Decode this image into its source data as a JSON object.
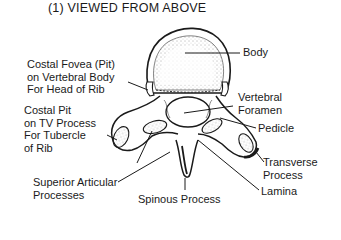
{
  "title": "(1) VIEWED FROM ABOVE",
  "labels": {
    "body": "Body",
    "costal_fovea": [
      "Costal Fovea (Pit)",
      "on Vertebral Body",
      "For Head of Rib"
    ],
    "costal_pit": [
      "Costal Pit",
      "on TV Process",
      "For Tubercle",
      "of Rib"
    ],
    "vertebral_foramen": [
      "Vertebral",
      "Foramen"
    ],
    "pedicle": "Pedicle",
    "transverse_process": [
      "Transverse",
      "Process"
    ],
    "lamina": "Lamina",
    "superior_articular": [
      "Superior Articular",
      "Processes"
    ],
    "spinous_process": "Spinous Process"
  },
  "colors": {
    "ink": "#1a1a1a",
    "background": "#ffffff",
    "stipple": "#555555"
  }
}
